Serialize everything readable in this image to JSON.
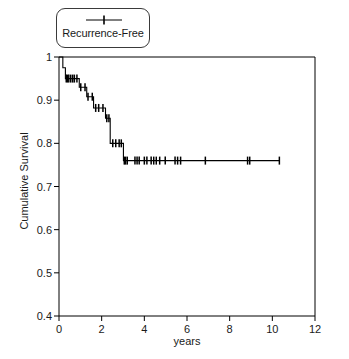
{
  "chart_data": {
    "type": "line",
    "plot_kind": "kaplan-meier-step",
    "title": "",
    "subtitle": "",
    "xlabel": "years",
    "ylabel": "Cumulative Survival",
    "xlim": [
      0,
      12
    ],
    "ylim": [
      0.4,
      1.0
    ],
    "xticks": [
      0,
      2,
      4,
      6,
      8,
      10,
      12
    ],
    "xtick_labels": [
      "0",
      "2",
      "4",
      "6",
      "8",
      "10",
      "12"
    ],
    "yticks": [
      0.4,
      0.5,
      0.6,
      0.7,
      0.8,
      0.9,
      1.0
    ],
    "ytick_labels": [
      "0.4",
      "0.5",
      "0.6",
      "0.7",
      "0.8",
      "0.9",
      "1"
    ],
    "grid": false,
    "legend_position": "top-left-outside",
    "series": [
      {
        "name": "Recurrence-Free",
        "color": "#000000",
        "marker": "censor-tick",
        "step_points": [
          [
            0.0,
            1.0
          ],
          [
            0.18,
            1.0
          ],
          [
            0.18,
            0.975
          ],
          [
            0.3,
            0.975
          ],
          [
            0.3,
            0.95
          ],
          [
            0.95,
            0.95
          ],
          [
            0.95,
            0.93
          ],
          [
            1.3,
            0.93
          ],
          [
            1.3,
            0.908
          ],
          [
            1.62,
            0.908
          ],
          [
            1.62,
            0.882
          ],
          [
            2.18,
            0.882
          ],
          [
            2.18,
            0.858
          ],
          [
            2.4,
            0.858
          ],
          [
            2.4,
            0.8
          ],
          [
            3.02,
            0.8
          ],
          [
            3.02,
            0.76
          ],
          [
            10.33,
            0.76
          ]
        ],
        "censor_marks": [
          [
            0.34,
            0.95
          ],
          [
            0.4,
            0.95
          ],
          [
            0.46,
            0.95
          ],
          [
            0.55,
            0.95
          ],
          [
            0.64,
            0.95
          ],
          [
            0.72,
            0.95
          ],
          [
            0.84,
            0.95
          ],
          [
            1.02,
            0.93
          ],
          [
            1.22,
            0.93
          ],
          [
            1.36,
            0.908
          ],
          [
            1.56,
            0.908
          ],
          [
            1.72,
            0.882
          ],
          [
            1.86,
            0.882
          ],
          [
            2.06,
            0.882
          ],
          [
            2.24,
            0.858
          ],
          [
            2.34,
            0.858
          ],
          [
            2.52,
            0.8
          ],
          [
            2.66,
            0.8
          ],
          [
            2.82,
            0.8
          ],
          [
            2.92,
            0.8
          ],
          [
            3.06,
            0.76
          ],
          [
            3.12,
            0.76
          ],
          [
            3.2,
            0.76
          ],
          [
            3.56,
            0.76
          ],
          [
            3.66,
            0.76
          ],
          [
            3.76,
            0.76
          ],
          [
            4.0,
            0.76
          ],
          [
            4.12,
            0.76
          ],
          [
            4.32,
            0.76
          ],
          [
            4.44,
            0.76
          ],
          [
            4.56,
            0.76
          ],
          [
            4.72,
            0.76
          ],
          [
            4.98,
            0.76
          ],
          [
            5.44,
            0.76
          ],
          [
            5.56,
            0.76
          ],
          [
            5.7,
            0.76
          ],
          [
            6.86,
            0.76
          ],
          [
            8.84,
            0.76
          ],
          [
            8.94,
            0.76
          ],
          [
            10.33,
            0.76
          ]
        ]
      }
    ]
  },
  "legend": {
    "entries": [
      {
        "label": "Recurrence-Free",
        "symbol": "line-with-censor-tick"
      }
    ]
  },
  "axes": {
    "x_title": "years",
    "y_title": "Cumulative Survival"
  }
}
